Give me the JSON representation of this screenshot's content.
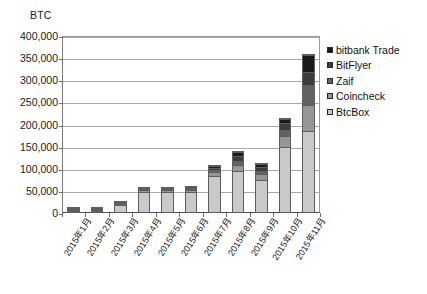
{
  "axis_unit_label": "BTC",
  "legend": {
    "position": "right",
    "items": [
      {
        "label": "bitbank Trade",
        "color": "#1a1a1a"
      },
      {
        "label": "BitFlyer",
        "color": "#3d3d3d"
      },
      {
        "label": "Zaif",
        "color": "#636363"
      },
      {
        "label": "Coincheck",
        "color": "#969696"
      },
      {
        "label": "BtcBox",
        "color": "#c9c9c9"
      }
    ]
  },
  "y_axis": {
    "ticks": [
      "0",
      "50,000",
      "100,000",
      "150,000",
      "200,000",
      "250,000",
      "300,000",
      "350,000",
      "400,000"
    ],
    "min": 0,
    "max": 400000,
    "step": 50000
  },
  "chart_data": {
    "type": "bar",
    "subtype": "stacked-vertical",
    "title": "",
    "xlabel": "",
    "ylabel": "BTC",
    "ylim": [
      0,
      400000
    ],
    "ytick_step": 50000,
    "grid": true,
    "legend_position": "right",
    "categories": [
      "2015年1月",
      "2015年2月",
      "2015年3月",
      "2015年4月",
      "2015年5月",
      "2015年6月",
      "2015年7月",
      "2015年8月",
      "2015年9月",
      "2015年10月",
      "2015年11月"
    ],
    "series": [
      {
        "name": "BtcBox",
        "color": "#c9c9c9",
        "values": [
          9000,
          9000,
          20000,
          50000,
          50000,
          52000,
          85000,
          95000,
          75000,
          150000,
          185000
        ]
      },
      {
        "name": "Coincheck",
        "color": "#969696",
        "values": [
          2000,
          2500,
          5000,
          5000,
          5000,
          6000,
          10000,
          15000,
          14000,
          25000,
          60000
        ]
      },
      {
        "name": "Zaif",
        "color": "#636363",
        "values": [
          1000,
          1000,
          2000,
          2000,
          2000,
          2000,
          5000,
          10000,
          8000,
          15000,
          45000
        ]
      },
      {
        "name": "BitFlyer",
        "color": "#3d3d3d",
        "values": [
          500,
          500,
          1000,
          1000,
          1000,
          1000,
          5000,
          12000,
          9000,
          15000,
          30000
        ]
      },
      {
        "name": "bitbank Trade",
        "color": "#1a1a1a",
        "values": [
          0,
          0,
          0,
          0,
          0,
          1000,
          3000,
          8000,
          6000,
          10000,
          40000
        ]
      }
    ],
    "totals": [
      12500,
      13000,
      28000,
      58000,
      58000,
      62000,
      108000,
      140000,
      112000,
      215000,
      360000
    ]
  }
}
